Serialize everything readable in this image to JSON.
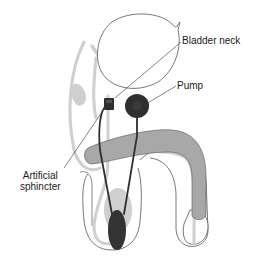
{
  "diagram": {
    "labels": {
      "bladder_neck": "Bladder neck",
      "pump": "Pump",
      "artificial_sphincter_line1": "Artificial",
      "artificial_sphincter_line2": "sphincter"
    },
    "components": [
      {
        "name": "bladder",
        "style": "outline"
      },
      {
        "name": "urethra",
        "style": "light-gray"
      },
      {
        "name": "cuff",
        "style": "dark"
      },
      {
        "name": "reservoir-balloon",
        "style": "dark"
      },
      {
        "name": "pump",
        "style": "dark"
      },
      {
        "name": "tubing",
        "style": "dark"
      },
      {
        "name": "penile-shaft",
        "style": "mid-gray"
      }
    ],
    "colors": {
      "outline": "#555555",
      "light_tissue": "#cfcfcf",
      "shaft": "#a8a8a8",
      "device": "#2f2f2f",
      "text": "#1a1a1a"
    }
  }
}
